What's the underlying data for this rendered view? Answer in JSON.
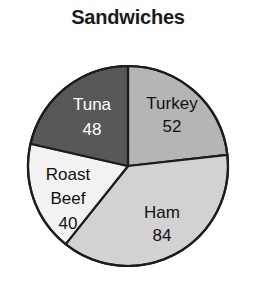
{
  "chart_data": {
    "type": "pie",
    "title": "Sandwiches",
    "xlabel": "",
    "ylabel": "",
    "legend": "none",
    "grid": false,
    "total": 224,
    "categories": [
      "Turkey",
      "Ham",
      "Roast Beef",
      "Tuna"
    ],
    "values": [
      52,
      84,
      40,
      48
    ],
    "slices": [
      {
        "label": "Turkey",
        "value": "52",
        "numeric": 52,
        "color": "#b5b5b5",
        "text_color": "#111111",
        "text_class": "label-dark",
        "start_angle": 0,
        "end_angle": 83.57,
        "label_x": 172,
        "label_y": 105,
        "value_x": 172,
        "value_y": 128,
        "label_lines": [
          "Turkey"
        ]
      },
      {
        "label": "Ham",
        "value": "84",
        "numeric": 84,
        "color": "#d2d2d2",
        "text_color": "#111111",
        "text_class": "label-dark",
        "start_angle": 83.57,
        "end_angle": 218.57,
        "label_x": 162,
        "label_y": 214,
        "value_x": 162,
        "value_y": 237,
        "label_lines": [
          "Ham"
        ]
      },
      {
        "label": "Roast Beef",
        "value": "40",
        "numeric": 40,
        "color": "#f2f2f2",
        "text_color": "#111111",
        "text_class": "label-dark",
        "start_angle": 218.57,
        "end_angle": 282.86,
        "label_x": 68,
        "label_y": 176,
        "value_x": 68,
        "value_y": 225,
        "label_lines": [
          "Roast",
          "Beef"
        ]
      },
      {
        "label": "Tuna",
        "value": "48",
        "numeric": 48,
        "color": "#585858",
        "text_color": "#ffffff",
        "text_class": "label-light",
        "start_angle": 282.86,
        "end_angle": 360,
        "label_x": 92,
        "label_y": 106,
        "value_x": 92,
        "value_y": 131,
        "label_lines": [
          "Tuna"
        ]
      }
    ],
    "geometry": {
      "center_x": 128,
      "center_y": 166,
      "radius": 100
    },
    "outline_color": "#1c1c1c"
  }
}
